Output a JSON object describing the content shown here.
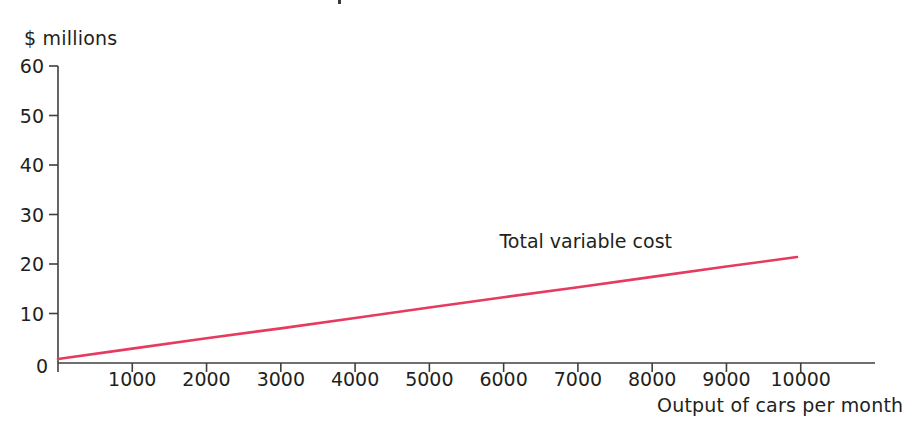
{
  "figure": {
    "background_color": "#ffffff",
    "axis_color": "#3f3f3f",
    "text_color": "#231f20"
  },
  "chart_data": {
    "type": "line",
    "title": "",
    "subtitle": "",
    "xlabel": "Output of cars per month",
    "ylabel": "$ millions",
    "xlim": [
      0,
      11000
    ],
    "ylim": [
      0,
      60
    ],
    "xticks": [
      0,
      1000,
      2000,
      3000,
      4000,
      5000,
      6000,
      7000,
      8000,
      9000,
      10000
    ],
    "xticklabels": [
      "0",
      "1000",
      "2000",
      "3000",
      "4000",
      "5000",
      "6000",
      "7000",
      "8000",
      "9000",
      "10000"
    ],
    "yticks": [
      0,
      10,
      20,
      30,
      40,
      50,
      60
    ],
    "yticklabels": [
      "0",
      "10",
      "20",
      "30",
      "40",
      "50",
      "60"
    ],
    "grid": false,
    "legend": "none",
    "series": [
      {
        "name": "Total variable cost",
        "color": "#e63a5e",
        "line_width": 2.6,
        "annotation": "Total variable cost",
        "annotation_x": 8300,
        "annotation_y": 24.5,
        "x": [
          0,
          1000,
          2000,
          3000,
          4000,
          5000,
          6000,
          7000,
          8000,
          9000,
          9950
        ],
        "y": [
          0.8,
          2.9,
          5.0,
          7.0,
          9.1,
          11.2,
          13.3,
          15.3,
          17.4,
          19.5,
          21.4
        ]
      }
    ],
    "annotations": [
      {
        "text": "Total variable cost",
        "x": 8300,
        "y": 24.5
      }
    ]
  },
  "axes": {
    "y_axis_title": "$ millions",
    "x_axis_title": "Output of cars per month",
    "origin_label": "0"
  },
  "series_labels": {
    "total_variable_cost": "Total variable cost"
  }
}
